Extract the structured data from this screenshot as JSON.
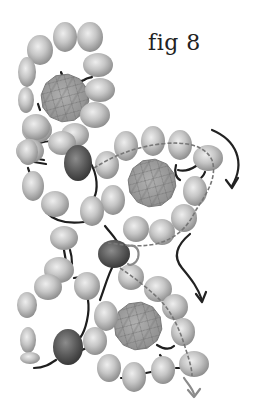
{
  "figure": {
    "caption": "fig 8"
  },
  "colors": {
    "bead_light": "#d8d8d8",
    "bead_mid": "#a8a8a8",
    "bead_dark": "#5a5a5a",
    "accent_bead_light": "#888888",
    "accent_bead_dark": "#3a3a3a",
    "crystal": "#9a9a9a",
    "thread": "#1e1e1e",
    "thread_path_dashed": "#777777",
    "arrow_dark": "#222222",
    "arrow_light": "#8a8a8a"
  },
  "crystals": [
    {
      "cx": 65,
      "cy": 98,
      "r": 24
    },
    {
      "cx": 152,
      "cy": 183,
      "r": 24
    },
    {
      "cx": 138,
      "cy": 326,
      "r": 24
    }
  ],
  "beads": [
    {
      "cx": 40,
      "cy": 50,
      "rx": 13,
      "ry": 15
    },
    {
      "cx": 65,
      "cy": 37,
      "rx": 12,
      "ry": 15
    },
    {
      "cx": 90,
      "cy": 37,
      "rx": 13,
      "ry": 15
    },
    {
      "cx": 98,
      "cy": 65,
      "rx": 15,
      "ry": 12
    },
    {
      "cx": 100,
      "cy": 90,
      "rx": 15,
      "ry": 12
    },
    {
      "cx": 95,
      "cy": 115,
      "rx": 15,
      "ry": 13
    },
    {
      "cx": 75,
      "cy": 135,
      "rx": 14,
      "ry": 12
    },
    {
      "cx": 37,
      "cy": 130,
      "rx": 15,
      "ry": 13
    },
    {
      "cx": 27,
      "cy": 72,
      "rx": 9,
      "ry": 15
    },
    {
      "cx": 26,
      "cy": 100,
      "rx": 8,
      "ry": 13
    },
    {
      "cx": 36,
      "cy": 127,
      "rx": 14,
      "ry": 13
    },
    {
      "cx": 62,
      "cy": 143,
      "rx": 14,
      "ry": 12
    },
    {
      "cx": 30,
      "cy": 151,
      "rx": 14,
      "ry": 12
    },
    {
      "cx": 126,
      "cy": 146,
      "rx": 12,
      "ry": 15
    },
    {
      "cx": 153,
      "cy": 141,
      "rx": 12,
      "ry": 15
    },
    {
      "cx": 180,
      "cy": 145,
      "rx": 12,
      "ry": 15
    },
    {
      "cx": 208,
      "cy": 158,
      "rx": 15,
      "ry": 13
    },
    {
      "cx": 195,
      "cy": 191,
      "rx": 12,
      "ry": 15
    },
    {
      "cx": 184,
      "cy": 218,
      "rx": 13,
      "ry": 14
    },
    {
      "cx": 162,
      "cy": 232,
      "rx": 13,
      "ry": 13
    },
    {
      "cx": 136,
      "cy": 229,
      "rx": 13,
      "ry": 13
    },
    {
      "cx": 113,
      "cy": 200,
      "rx": 12,
      "ry": 15
    },
    {
      "cx": 107,
      "cy": 165,
      "rx": 12,
      "ry": 14
    },
    {
      "cx": 33,
      "cy": 186,
      "rx": 11,
      "ry": 15
    },
    {
      "cx": 28,
      "cy": 152,
      "rx": 10,
      "ry": 13
    },
    {
      "cx": 55,
      "cy": 204,
      "rx": 14,
      "ry": 13
    },
    {
      "cx": 92,
      "cy": 211,
      "rx": 12,
      "ry": 15
    },
    {
      "cx": 64,
      "cy": 238,
      "rx": 14,
      "ry": 12
    },
    {
      "cx": 59,
      "cy": 270,
      "rx": 15,
      "ry": 13
    },
    {
      "cx": 48,
      "cy": 287,
      "rx": 14,
      "ry": 13
    },
    {
      "cx": 87,
      "cy": 286,
      "rx": 13,
      "ry": 14
    },
    {
      "cx": 106,
      "cy": 316,
      "rx": 12,
      "ry": 15
    },
    {
      "cx": 131,
      "cy": 277,
      "rx": 13,
      "ry": 13
    },
    {
      "cx": 158,
      "cy": 289,
      "rx": 14,
      "ry": 13
    },
    {
      "cx": 175,
      "cy": 307,
      "rx": 13,
      "ry": 13
    },
    {
      "cx": 183,
      "cy": 332,
      "rx": 12,
      "ry": 14
    },
    {
      "cx": 194,
      "cy": 364,
      "rx": 15,
      "ry": 13
    },
    {
      "cx": 163,
      "cy": 370,
      "rx": 12,
      "ry": 14
    },
    {
      "cx": 134,
      "cy": 377,
      "rx": 12,
      "ry": 15
    },
    {
      "cx": 109,
      "cy": 368,
      "rx": 12,
      "ry": 14
    },
    {
      "cx": 95,
      "cy": 341,
      "rx": 12,
      "ry": 14
    },
    {
      "cx": 27,
      "cy": 305,
      "rx": 10,
      "ry": 13
    },
    {
      "cx": 28,
      "cy": 340,
      "rx": 8,
      "ry": 13
    },
    {
      "cx": 30,
      "cy": 358,
      "rx": 10,
      "ry": 6
    }
  ],
  "accent_beads": [
    {
      "cx": 78,
      "cy": 163,
      "rx": 14,
      "ry": 18
    },
    {
      "cx": 114,
      "cy": 254,
      "rx": 16,
      "ry": 14
    },
    {
      "cx": 68,
      "cy": 347,
      "rx": 15,
      "ry": 18
    }
  ],
  "threads": [
    "M61 72 C62 80 72 78 68 86 M68 86 C72 80 78 84 84 80 C88 77 90 78 92 77",
    "M30 148 C45 138 60 140 72 148",
    "M90 162 C98 175 98 190 94 198",
    "M46 212 C55 222 68 224 84 222",
    "M28 168 C30 172 30 176 30 178",
    "M64 250 C65 256 66 260 66 264",
    "M70 250 C72 256 72 260 72 264",
    "M74 278 C82 276 86 276 92 276",
    "M105 226 C112 235 118 240 120 248",
    "M100 300 C104 290 108 274 114 264",
    "M88 300 C90 312 86 330 80 338",
    "M34 368 C44 368 50 364 56 360",
    "M82 350 C88 348 92 344 94 340",
    "M196 166 C190 170 185 172 178 170",
    "M176 165 C174 172 176 178 180 180",
    "M205 172 C203 178 198 180 196 182",
    "M157 345 C165 350 170 350 174 346",
    "M160 355 C164 360 166 364 166 368",
    "M121 378 C124 378 124 378 124 378",
    "M146 373 L151 372",
    "M176 368 L181 368",
    "M38 104 L40 110",
    "M32 158 L44 160",
    "M34 162 L46 164"
  ],
  "dashed_paths": [
    "M94 168 C110 158 130 148 160 144 C185 141 205 145 212 160 C218 178 205 196 196 210 C188 226 178 238 156 244 C136 248 120 244 108 243",
    "M120 268 C135 278 150 290 160 300 C172 312 180 330 186 350 C190 362 192 370 192 376"
  ],
  "arrows": [
    {
      "d": "M212 130 C236 140 246 162 232 186",
      "head": "M226 180 L232 188 L238 178",
      "color": "arrow_dark"
    },
    {
      "d": "M190 234 C178 244 172 256 182 268 C192 280 198 288 202 300",
      "head": "M196 294 L202 302 L206 292",
      "color": "arrow_dark"
    },
    {
      "d": "M184 378 C188 384 192 388 194 394",
      "head": "M188 390 L194 397 L200 389",
      "color": "arrow_light"
    },
    {
      "d": "M128 246 C136 244 140 250 138 258 C136 264 130 266 128 264",
      "head": "",
      "color": "arrow_light"
    }
  ]
}
